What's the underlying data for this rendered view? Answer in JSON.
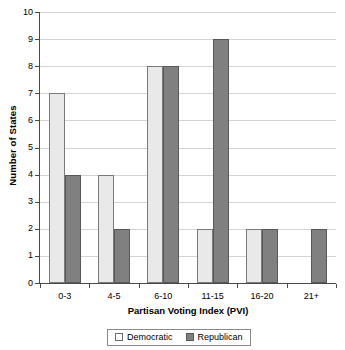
{
  "chart_data": {
    "type": "bar",
    "title": "",
    "xlabel": "Partisan Voting Index (PVI)",
    "ylabel": "Number of States",
    "categories": [
      "0-3",
      "4-5",
      "6-10",
      "11-15",
      "16-20",
      "21+"
    ],
    "series": [
      {
        "name": "Democratic",
        "color": "#e9e9e9",
        "values": [
          7,
          4,
          8,
          2,
          2,
          0
        ]
      },
      {
        "name": "Republican",
        "color": "#808080",
        "values": [
          4,
          2,
          8,
          9,
          2,
          2
        ]
      }
    ],
    "ylim": [
      0,
      10
    ],
    "ytick_labels": [
      "10",
      "9",
      "8",
      "7",
      "6",
      "5",
      "4",
      "3",
      "2",
      "1",
      "0"
    ],
    "ytick_values": [
      10,
      9,
      8,
      7,
      6,
      5,
      4,
      3,
      2,
      1,
      0
    ],
    "grid": true,
    "legend_position": "bottom",
    "legend_entries": [
      "Democratic",
      "Republican"
    ]
  }
}
